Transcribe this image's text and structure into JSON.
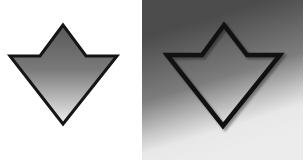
{
  "figure": {
    "panels": [
      {
        "id": "left",
        "description": "Down-arrow shape with dark outline, filled with vertical gray gradient (dark top to light bottom) on white background",
        "fill_gradient": [
          "#5c5c5c",
          "#e8e8e8"
        ],
        "outline_color": "#151515",
        "background": "#ffffff"
      },
      {
        "id": "right",
        "description": "Same down-arrow outline shape, transparent fill, on a diagonal gray gradient background (dark upper-left to light lower-right)",
        "background_gradient": [
          "#4a4a4a",
          "#8a8a8a",
          "#e6e6e6"
        ],
        "outline_color": "#111111"
      }
    ],
    "icon": "down-arrow-icon"
  }
}
